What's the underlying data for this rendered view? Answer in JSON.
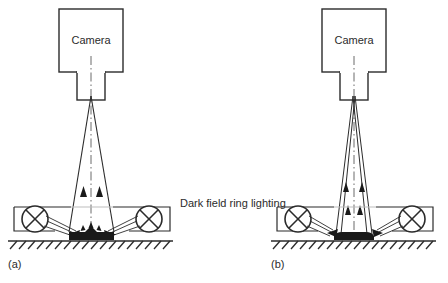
{
  "figure": {
    "background_color": "#ffffff",
    "line_color": "#2b2b2b",
    "object_fill_color": "#1a1a1a",
    "annotation_label": "Dark field ring lighting",
    "panels": [
      {
        "id": "a",
        "caption": "(a)",
        "camera_label": "Camera",
        "description": "Dark field ring lighting with surface defect scattering light up into the camera",
        "lamp_icon_left": "lamp-cross-circle-icon",
        "lamp_icon_right": "lamp-cross-circle-icon"
      },
      {
        "id": "b",
        "caption": "(b)",
        "camera_label": "Camera",
        "description": "Dark field ring lighting with light reflecting from object edges into the camera",
        "lamp_icon_left": "lamp-cross-circle-icon",
        "lamp_icon_right": "lamp-cross-circle-icon"
      }
    ]
  }
}
